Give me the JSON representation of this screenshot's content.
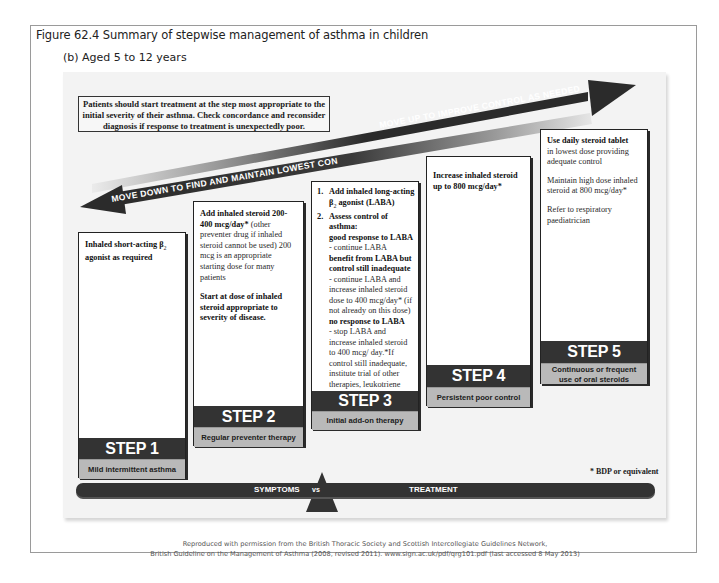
{
  "figure": {
    "title": "Figure 62.4   Summary of stepwise management of asthma in children",
    "subtitle": "(b) Aged 5 to 12 years"
  },
  "note_box": {
    "lines": [
      "Patients should start treatment at the step most appropriate to the",
      "initial severity of their asthma. Check concordance and reconsider",
      "diagnosis if response to treatment is unexpectedly poor."
    ]
  },
  "arrows": {
    "up_label": "MOVE UP TO IMPROVE CONTROL AS NEEDED",
    "down_label": "MOVE DOWN TO FIND AND MAINTAIN LOWEST CONTROLLING STEP",
    "color_dark": "#2b2b2b",
    "color_light": "#c8c8c8"
  },
  "steps": [
    {
      "label": "STEP 1",
      "subtitle": "Mild intermittent asthma",
      "body": {
        "bold": "Inhaled short-acting β",
        "sub": "2",
        "bold2": " agonist as required"
      }
    },
    {
      "label": "STEP 2",
      "subtitle": "Regular preventer therapy",
      "body": {
        "p1_bold": "Add inhaled steroid 200-400 mcg/day*",
        "p1_text": " (other preventer drug if inhaled steroid cannot be used) 200 mcg is an appropriate starting dose for many patients",
        "p2_bold": "Start at dose of inhaled steroid appropriate to severity of disease."
      }
    },
    {
      "label": "STEP 3",
      "subtitle": "Initial add-on therapy",
      "body": {
        "item1_num": "1.",
        "item1_bold": "Add inhaled long-acting β",
        "item1_sub": "2",
        "item1_bold2": " agonist (LABA)",
        "item2_num": "2.",
        "item2_bold": "Assess control of asthma:",
        "r1_bold": "good response to LABA",
        "r1_text": "- continue LABA",
        "r2_bold": "benefit from LABA but control still inadequate",
        "r2_text": "- continue LABA and increase inhaled steroid dose to 400 mcg/day* (if not already on this dose)",
        "r3_bold": "no response to LABA",
        "r3_text": "- stop LABA and increase inhaled steroid to 400 mcg/ day.*If control still inadequate, institute trial of other therapies, leukotriene receptor antagonist or SR theophylline"
      }
    },
    {
      "label": "STEP 4",
      "subtitle": "Persistent poor control",
      "body": {
        "bold": "Increase inhaled steroid up to 800 mcg/day*"
      }
    },
    {
      "label": "STEP 5",
      "subtitle_lines": [
        "Continuous or frequent",
        "use of oral steroids"
      ],
      "body": {
        "p1_bold": "Use daily steroid tablet",
        "p1_text": "in lowest dose providing adequate control",
        "p2_text": "Maintain high dose inhaled steroid at 800 mcg/day*",
        "p3_text": "Refer to respiratory paediatrician"
      }
    }
  ],
  "footnote": "* BDP or equivalent",
  "balance": {
    "left": "SYMPTOMS",
    "middle": "vs",
    "right": "TREATMENT"
  },
  "citation": {
    "line1": "Reproduced with permission from the British Thoracic Society and Scottish Intercollegiate Guidelines Network,",
    "line2": "British Guideline on the Management of Asthma (2008, revised 2011). www.sign.ac.uk/pdf/qrg101.pdf (last accessed 8 May 2013)"
  }
}
